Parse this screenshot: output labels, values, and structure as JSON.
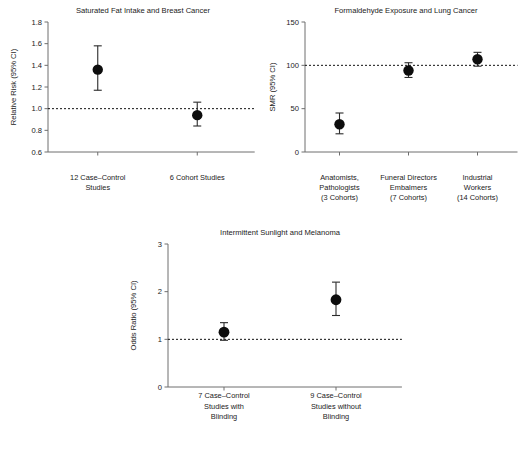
{
  "figure": {
    "name": "meta-analysis-forest-panels",
    "background": "#ffffff",
    "point_color": "#0d0d0d",
    "line_color": "#2b2b2b",
    "axis_color": "#6e6e6e"
  },
  "chart_data": [
    {
      "id": "saturated-fat-breast-cancer",
      "type": "scatter",
      "title": "Saturated Fat Intake and Breast Cancer",
      "xlabel": "",
      "ylabel": "Relative Risk (95% CI)",
      "ylim": [
        0.6,
        1.8
      ],
      "yticks": [
        0.6,
        0.8,
        1.0,
        1.2,
        1.4,
        1.6,
        1.8
      ],
      "ytick_labels": [
        "0.6",
        "0.8",
        "1.0",
        "1.2",
        "1.4",
        "1.6",
        "1.8"
      ],
      "reference_line": 1.0,
      "grid": false,
      "legend": "none",
      "categories": [
        "12 Case–Control Studies",
        "6 Cohort Studies"
      ],
      "category_lines": [
        [
          "12 Case–Control",
          "Studies"
        ],
        [
          "6 Cohort Studies"
        ]
      ],
      "values": [
        1.36,
        0.94
      ],
      "ci_low": [
        1.17,
        0.84
      ],
      "ci_high": [
        1.58,
        1.06
      ]
    },
    {
      "id": "formaldehyde-lung-cancer",
      "type": "scatter",
      "title": "Formaldehyde Exposure and Lung Cancer",
      "xlabel": "",
      "ylabel": "SMR (95% CI)",
      "ylim": [
        0,
        150
      ],
      "yticks": [
        0,
        50,
        100,
        150
      ],
      "ytick_labels": [
        "0",
        "50",
        "100",
        "150"
      ],
      "reference_line": 100,
      "grid": false,
      "legend": "none",
      "categories": [
        "Anatomists, Pathologists (3 Cohorts)",
        "Funeral Directors Embalmers (7 Cohorts)",
        "Industrial Workers (14 Cohorts)"
      ],
      "category_lines": [
        [
          "Anatomists,",
          "Pathologists",
          "(3 Cohorts)"
        ],
        [
          "Funeral Directors",
          "Embalmers",
          "(7 Cohorts)"
        ],
        [
          "Industrial",
          "Workers",
          "(14 Cohorts)"
        ]
      ],
      "values": [
        32,
        94,
        107
      ],
      "ci_low": [
        21,
        86,
        99
      ],
      "ci_high": [
        45,
        103,
        115
      ]
    },
    {
      "id": "intermittent-sunlight-melanoma",
      "type": "scatter",
      "title": "Intermittent Sunlight and Melanoma",
      "xlabel": "",
      "ylabel": "Odds Ratio (95% CI)",
      "ylim": [
        0,
        3
      ],
      "yticks": [
        0,
        1,
        2,
        3
      ],
      "ytick_labels": [
        "0",
        "1",
        "2",
        "3"
      ],
      "reference_line": 1.0,
      "grid": false,
      "legend": "none",
      "categories": [
        "7 Case–Control Studies with Blinding",
        "9 Case–Control Studies without Blinding"
      ],
      "category_lines": [
        [
          "7 Case–Control",
          "Studies with",
          "Blinding"
        ],
        [
          "9 Case–Control",
          "Studies without",
          "Blinding"
        ]
      ],
      "values": [
        1.15,
        1.83
      ],
      "ci_low": [
        0.98,
        1.5
      ],
      "ci_high": [
        1.35,
        2.2
      ]
    }
  ]
}
